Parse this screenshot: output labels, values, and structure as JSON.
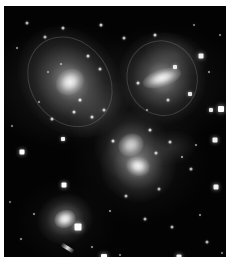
{
  "page": {
    "background_color": "#ffffff",
    "plate_background_color": "#030303",
    "plate": {
      "x": 4,
      "y": 6,
      "width": 222,
      "height": 251
    }
  },
  "image": {
    "title": "Stephan's Quintet",
    "subject": "compact galaxy group",
    "medium": "optical astronomical photograph",
    "palette": {
      "sky": "#030303",
      "faint_nebulosity": "#2a2a2a",
      "galaxy_mid": "#8f8f8f",
      "galaxy_core": "#f2f2f2",
      "star": "#ffffff",
      "border": "#ffffff"
    }
  },
  "galaxies": [
    {
      "name": "upper-left-spiral-galaxy",
      "cx": 66,
      "cy": 76,
      "halo_w": 96,
      "halo_h": 118,
      "rotate": -36,
      "core_w": 30,
      "core_h": 26,
      "brightness": "bright",
      "type": "spiral"
    },
    {
      "name": "upper-right-galaxy",
      "cx": 158,
      "cy": 72,
      "halo_w": 86,
      "halo_h": 92,
      "rotate": -18,
      "core_w": 40,
      "core_h": 18,
      "brightness": "bright",
      "type": "distorted-spiral"
    },
    {
      "name": "central-interacting-pair-north",
      "cx": 127,
      "cy": 139,
      "halo_w": 74,
      "halo_h": 70,
      "rotate": -25,
      "core_w": 26,
      "core_h": 22,
      "brightness": "medium",
      "type": "interacting"
    },
    {
      "name": "central-interacting-pair-south",
      "cx": 134,
      "cy": 160,
      "halo_w": 76,
      "halo_h": 72,
      "rotate": 14,
      "core_w": 24,
      "core_h": 20,
      "brightness": "bright",
      "type": "interacting"
    },
    {
      "name": "lower-left-elliptical-galaxy",
      "cx": 61,
      "cy": 213,
      "halo_w": 56,
      "halo_h": 50,
      "rotate": -20,
      "core_w": 22,
      "core_h": 18,
      "brightness": "bright",
      "type": "elliptical"
    }
  ],
  "tidal_features": [
    {
      "name": "bridge-upper-left-to-centre",
      "cx": 96,
      "cy": 104,
      "w": 70,
      "h": 44,
      "rotate": -40
    },
    {
      "name": "plume-upper-right",
      "cx": 172,
      "cy": 48,
      "w": 64,
      "h": 40,
      "rotate": 20
    },
    {
      "name": "tail-central-east",
      "cx": 166,
      "cy": 142,
      "w": 52,
      "h": 34,
      "rotate": -10
    }
  ],
  "stars": [
    {
      "x": 18,
      "y": 146,
      "s": 5,
      "b": 1.0
    },
    {
      "x": 59,
      "y": 133,
      "s": 4,
      "b": 0.95
    },
    {
      "x": 60,
      "y": 179,
      "s": 5,
      "b": 1.0
    },
    {
      "x": 74,
      "y": 221,
      "s": 7,
      "b": 1.0
    },
    {
      "x": 100,
      "y": 251,
      "s": 6,
      "b": 1.0
    },
    {
      "x": 175,
      "y": 251,
      "s": 5,
      "b": 0.95
    },
    {
      "x": 207,
      "y": 104,
      "s": 4,
      "b": 0.9
    },
    {
      "x": 217,
      "y": 103,
      "s": 6,
      "b": 1.0
    },
    {
      "x": 211,
      "y": 134,
      "s": 5,
      "b": 0.95
    },
    {
      "x": 212,
      "y": 181,
      "s": 5,
      "b": 0.95
    },
    {
      "x": 197,
      "y": 50,
      "s": 5,
      "b": 0.95
    },
    {
      "x": 171,
      "y": 61,
      "s": 4,
      "b": 0.9
    },
    {
      "x": 186,
      "y": 88,
      "s": 4,
      "b": 0.9
    },
    {
      "x": 151,
      "y": 29,
      "s": 3,
      "b": 0.8
    },
    {
      "x": 120,
      "y": 32,
      "s": 3,
      "b": 0.75
    },
    {
      "x": 97,
      "y": 19,
      "s": 3,
      "b": 0.8
    },
    {
      "x": 59,
      "y": 22,
      "s": 3,
      "b": 0.75
    },
    {
      "x": 41,
      "y": 31,
      "s": 3,
      "b": 0.7
    },
    {
      "x": 23,
      "y": 17,
      "s": 3,
      "b": 0.7
    },
    {
      "x": 13,
      "y": 42,
      "s": 2,
      "b": 0.6
    },
    {
      "x": 84,
      "y": 50,
      "s": 3,
      "b": 0.8
    },
    {
      "x": 96,
      "y": 63,
      "s": 3,
      "b": 0.75
    },
    {
      "x": 88,
      "y": 111,
      "s": 3,
      "b": 0.8
    },
    {
      "x": 100,
      "y": 104,
      "s": 3,
      "b": 0.75
    },
    {
      "x": 48,
      "y": 113,
      "s": 3,
      "b": 0.75
    },
    {
      "x": 35,
      "y": 96,
      "s": 2,
      "b": 0.6
    },
    {
      "x": 109,
      "y": 135,
      "s": 3,
      "b": 0.8
    },
    {
      "x": 146,
      "y": 124,
      "s": 3,
      "b": 0.8
    },
    {
      "x": 152,
      "y": 147,
      "s": 3,
      "b": 0.75
    },
    {
      "x": 166,
      "y": 136,
      "s": 3,
      "b": 0.75
    },
    {
      "x": 178,
      "y": 151,
      "s": 2,
      "b": 0.65
    },
    {
      "x": 187,
      "y": 163,
      "s": 3,
      "b": 0.7
    },
    {
      "x": 192,
      "y": 139,
      "s": 2,
      "b": 0.6
    },
    {
      "x": 155,
      "y": 183,
      "s": 3,
      "b": 0.7
    },
    {
      "x": 122,
      "y": 190,
      "s": 3,
      "b": 0.7
    },
    {
      "x": 106,
      "y": 205,
      "s": 2,
      "b": 0.6
    },
    {
      "x": 141,
      "y": 213,
      "s": 3,
      "b": 0.7
    },
    {
      "x": 168,
      "y": 221,
      "s": 3,
      "b": 0.7
    },
    {
      "x": 196,
      "y": 209,
      "s": 2,
      "b": 0.6
    },
    {
      "x": 203,
      "y": 236,
      "s": 3,
      "b": 0.7
    },
    {
      "x": 30,
      "y": 208,
      "s": 2,
      "b": 0.6
    },
    {
      "x": 17,
      "y": 233,
      "s": 2,
      "b": 0.6
    },
    {
      "x": 88,
      "y": 241,
      "s": 2,
      "b": 0.6
    },
    {
      "x": 44,
      "y": 66,
      "s": 2,
      "b": 0.55
    },
    {
      "x": 76,
      "y": 94,
      "s": 3,
      "b": 0.85
    },
    {
      "x": 70,
      "y": 106,
      "s": 3,
      "b": 0.8
    },
    {
      "x": 57,
      "y": 58,
      "s": 2,
      "b": 0.6
    },
    {
      "x": 134,
      "y": 77,
      "s": 3,
      "b": 0.8
    },
    {
      "x": 164,
      "y": 94,
      "s": 3,
      "b": 0.75
    },
    {
      "x": 143,
      "y": 104,
      "s": 2,
      "b": 0.6
    },
    {
      "x": 205,
      "y": 66,
      "s": 2,
      "b": 0.6
    },
    {
      "x": 216,
      "y": 29,
      "s": 2,
      "b": 0.55
    },
    {
      "x": 190,
      "y": 19,
      "s": 2,
      "b": 0.55
    },
    {
      "x": 8,
      "y": 120,
      "s": 2,
      "b": 0.55
    },
    {
      "x": 6,
      "y": 196,
      "s": 2,
      "b": 0.5
    },
    {
      "x": 116,
      "y": 249,
      "s": 2,
      "b": 0.55
    },
    {
      "x": 218,
      "y": 247,
      "s": 2,
      "b": 0.55
    }
  ],
  "edge_on_streak": {
    "name": "edge-on-companion",
    "x": 56,
    "y": 240,
    "w": 15,
    "h": 4,
    "rotate": 32
  }
}
